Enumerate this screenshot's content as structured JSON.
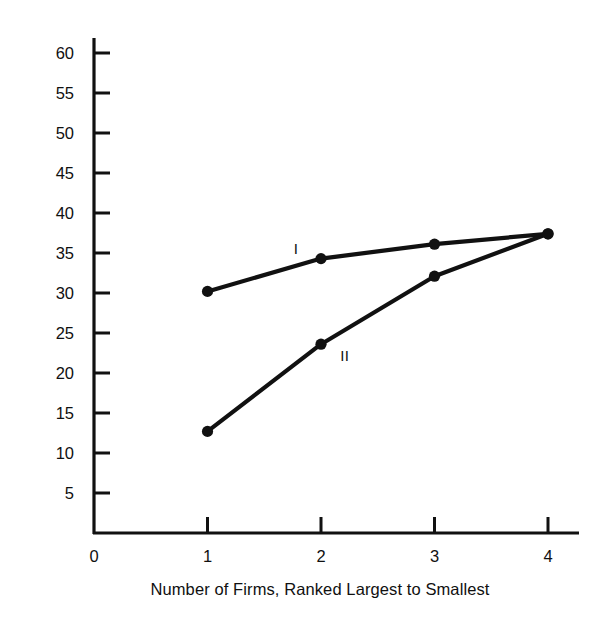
{
  "chart_data": {
    "type": "line",
    "title": "",
    "subtitle": "",
    "xlabel": "Number of Firms, Ranked Largest to Smallest",
    "ylabel": "Cumulative Percent of Shipments",
    "x": [
      1,
      2,
      3,
      4
    ],
    "xlim": [
      0,
      4.25
    ],
    "ylim": [
      0,
      62
    ],
    "xticks": [
      "0",
      "1",
      "2",
      "3",
      "4"
    ],
    "xtick_values": [
      0,
      1,
      2,
      3,
      4
    ],
    "yticks": [
      "5",
      "10",
      "15",
      "20",
      "25",
      "30",
      "35",
      "40",
      "45",
      "50",
      "55",
      "60"
    ],
    "ytick_values": [
      5,
      10,
      15,
      20,
      25,
      30,
      35,
      40,
      45,
      50,
      55,
      60
    ],
    "grid": false,
    "legend_position": "inline-annotation",
    "marker": "filled-circle",
    "line_color": "#111111",
    "series": [
      {
        "name": "I",
        "label": "I",
        "values": [
          30.2,
          34.3,
          36.1,
          37.4
        ],
        "label_x": 1.78,
        "label_y": 35.6
      },
      {
        "name": "II",
        "label": "II",
        "values": [
          12.7,
          23.6,
          32.1,
          37.4
        ],
        "label_x": 2.21,
        "label_y": 22.3
      }
    ],
    "annotations": [
      {
        "text": "I",
        "series": "I"
      },
      {
        "text": "II",
        "series": "II"
      }
    ]
  },
  "axes": {
    "x_axis_name": "x-axis",
    "y_axis_name": "y-axis"
  }
}
